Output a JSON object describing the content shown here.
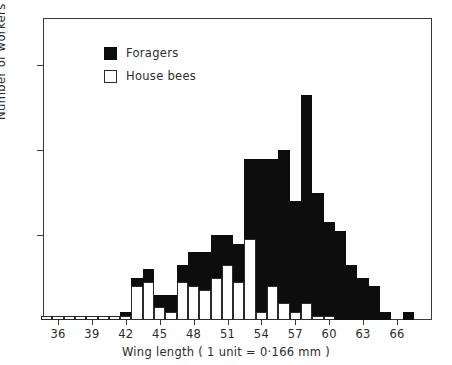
{
  "chart_data": {
    "type": "bar",
    "title": "",
    "subtitle": "",
    "xlabel": "Wing length  ( 1 unit = 0·166 mm )",
    "ylabel": "Number of workers",
    "stacked": true,
    "grid": false,
    "legend_position": "inside-top-left",
    "xlim": [
      34.5,
      67.5
    ],
    "ylim": [
      0,
      70
    ],
    "yticks": [
      20,
      40,
      60
    ],
    "ytick_labels": [
      "20",
      "40",
      "60"
    ],
    "xticks": [
      36,
      39,
      42,
      45,
      48,
      51,
      54,
      57,
      60,
      63,
      66
    ],
    "xtick_labels": [
      "36",
      "39",
      "42",
      "45",
      "48",
      "51",
      "54",
      "57",
      "60",
      "63",
      "66"
    ],
    "categories": [
      35,
      36,
      37,
      38,
      39,
      40,
      41,
      42,
      43,
      44,
      45,
      46,
      47,
      48,
      49,
      50,
      51,
      52,
      53,
      54,
      55,
      56,
      57,
      58,
      59,
      60,
      61,
      62,
      63,
      64,
      65,
      66,
      67
    ],
    "series": [
      {
        "name": "House bees",
        "color": "#ffffff",
        "values": [
          1,
          1,
          1,
          1,
          1,
          1,
          1,
          1,
          8,
          9,
          3,
          2,
          9,
          8,
          7,
          10,
          13,
          9,
          19,
          2,
          8,
          4,
          2,
          4,
          1,
          1,
          0,
          0,
          0,
          0,
          0,
          0,
          0
        ]
      },
      {
        "name": "Foragers",
        "color": "#0d0d0d",
        "values": [
          0,
          0,
          0,
          0,
          0,
          0,
          0,
          1,
          2,
          3,
          3,
          4,
          4,
          8,
          9,
          10,
          7,
          9,
          19,
          36,
          30,
          36,
          26,
          49,
          29,
          22,
          21,
          13,
          10,
          8,
          2,
          0,
          2
        ]
      }
    ],
    "totals": [
      1,
      1,
      1,
      1,
      1,
      1,
      1,
      2,
      10,
      12,
      6,
      6,
      13,
      16,
      16,
      20,
      20,
      18,
      38,
      38,
      38,
      40,
      28,
      53,
      30,
      23,
      21,
      13,
      10,
      8,
      2,
      0,
      2
    ]
  },
  "legend": {
    "items": [
      {
        "label": "Foragers",
        "swatch": "filled-black-square"
      },
      {
        "label": "House bees",
        "swatch": "open-white-square"
      }
    ]
  }
}
